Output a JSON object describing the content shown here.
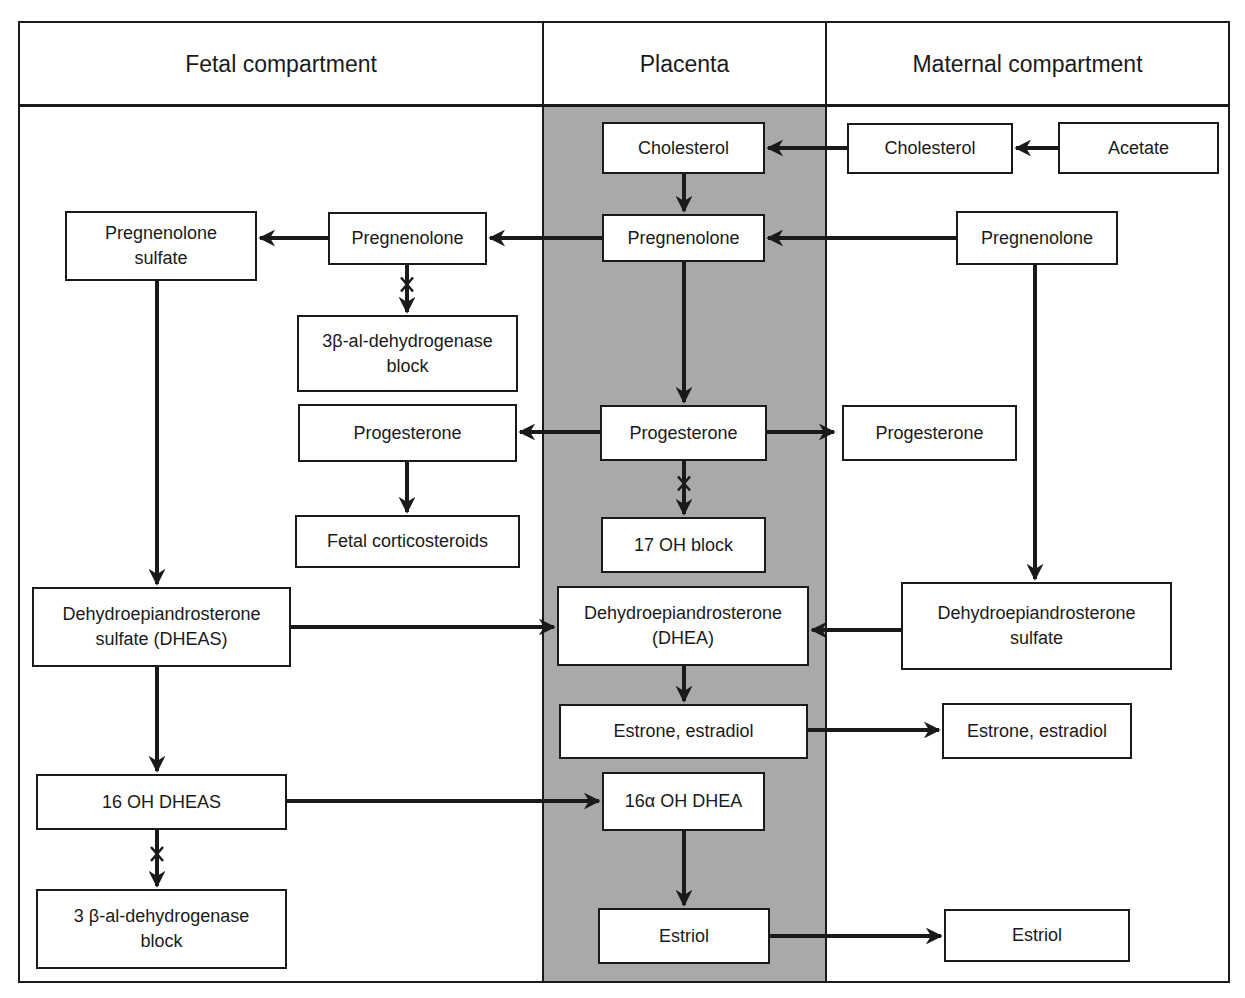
{
  "diagram": {
    "colors": {
      "placenta_fill": "#a9a9a9",
      "line": "#1a1a1a",
      "box_fill": "#ffffff"
    },
    "columns": [
      {
        "id": "fetal",
        "label": "Fetal compartment"
      },
      {
        "id": "placenta",
        "label": "Placenta"
      },
      {
        "id": "maternal",
        "label": "Maternal compartment"
      }
    ],
    "boxes": [
      {
        "id": "plac-cholesterol",
        "col": "placenta",
        "label": "Cholesterol",
        "x": 602,
        "y": 122,
        "w": 163,
        "h": 52
      },
      {
        "id": "mat-cholesterol",
        "col": "maternal",
        "label": "Cholesterol",
        "x": 847,
        "y": 123,
        "w": 166,
        "h": 51
      },
      {
        "id": "mat-acetate",
        "col": "maternal",
        "label": "Acetate",
        "x": 1058,
        "y": 122,
        "w": 161,
        "h": 52
      },
      {
        "id": "fet-preg-sulfate",
        "col": "fetal",
        "label": "Pregnenolone\nsulfate",
        "x": 65,
        "y": 211,
        "w": 192,
        "h": 70
      },
      {
        "id": "fet-pregnenolone",
        "col": "fetal",
        "label": "Pregnenolone",
        "x": 328,
        "y": 212,
        "w": 159,
        "h": 53
      },
      {
        "id": "plac-pregnenolone",
        "col": "placenta",
        "label": "Pregnenolone",
        "x": 602,
        "y": 214,
        "w": 163,
        "h": 48
      },
      {
        "id": "mat-pregnenolone",
        "col": "maternal",
        "label": "Pregnenolone",
        "x": 956,
        "y": 211,
        "w": 162,
        "h": 54
      },
      {
        "id": "fet-3b-block-1",
        "col": "fetal",
        "label": "3β-al-dehydrogenase\nblock",
        "x": 297,
        "y": 315,
        "w": 221,
        "h": 77
      },
      {
        "id": "fet-progesterone",
        "col": "fetal",
        "label": "Progesterone",
        "x": 298,
        "y": 404,
        "w": 219,
        "h": 58
      },
      {
        "id": "plac-progesterone",
        "col": "placenta",
        "label": "Progesterone",
        "x": 600,
        "y": 405,
        "w": 167,
        "h": 56
      },
      {
        "id": "mat-progesterone",
        "col": "maternal",
        "label": "Progesterone",
        "x": 842,
        "y": 405,
        "w": 175,
        "h": 56
      },
      {
        "id": "fet-corticosteroids",
        "col": "fetal",
        "label": "Fetal corticosteroids",
        "x": 295,
        "y": 515,
        "w": 225,
        "h": 53
      },
      {
        "id": "plac-17oh-block",
        "col": "placenta",
        "label": "17 OH block",
        "x": 601,
        "y": 517,
        "w": 165,
        "h": 56
      },
      {
        "id": "fet-dheas",
        "col": "fetal",
        "label": "Dehydroepiandrosterone\nsulfate (DHEAS)",
        "x": 32,
        "y": 587,
        "w": 259,
        "h": 80
      },
      {
        "id": "plac-dhea",
        "col": "placenta",
        "label": "Dehydroepiandrosterone\n(DHEA)",
        "x": 557,
        "y": 586,
        "w": 252,
        "h": 80
      },
      {
        "id": "mat-dhea-sulfate",
        "col": "maternal",
        "label": "Dehydroepiandrosterone\nsulfate",
        "x": 901,
        "y": 582,
        "w": 271,
        "h": 88
      },
      {
        "id": "plac-estrone",
        "col": "placenta",
        "label": "Estrone, estradiol",
        "x": 559,
        "y": 704,
        "w": 249,
        "h": 55
      },
      {
        "id": "mat-estrone",
        "col": "maternal",
        "label": "Estrone, estradiol",
        "x": 942,
        "y": 703,
        "w": 190,
        "h": 56
      },
      {
        "id": "fet-16oh-dheas",
        "col": "fetal",
        "label": "16  OH DHEAS",
        "x": 36,
        "y": 774,
        "w": 251,
        "h": 56
      },
      {
        "id": "plac-16a-oh-dhea",
        "col": "placenta",
        "label": "16α OH DHEA",
        "x": 602,
        "y": 772,
        "w": 163,
        "h": 59
      },
      {
        "id": "fet-3b-block-2",
        "col": "fetal",
        "label": "3 β-al-dehydrogenase\nblock",
        "x": 36,
        "y": 889,
        "w": 251,
        "h": 80
      },
      {
        "id": "plac-estriol",
        "col": "placenta",
        "label": "Estriol",
        "x": 598,
        "y": 908,
        "w": 172,
        "h": 56
      },
      {
        "id": "mat-estriol",
        "col": "maternal",
        "label": "Estriol",
        "x": 944,
        "y": 909,
        "w": 186,
        "h": 53
      }
    ],
    "arrows": [
      {
        "from": "mat-acetate",
        "to": "mat-cholesterol",
        "points": [
          [
            1058,
            148
          ],
          [
            1016,
            148
          ]
        ],
        "blocked": false
      },
      {
        "from": "mat-cholesterol",
        "to": "plac-cholesterol",
        "points": [
          [
            847,
            148
          ],
          [
            768,
            148
          ]
        ],
        "blocked": false
      },
      {
        "from": "plac-cholesterol",
        "to": "plac-pregnenolone",
        "points": [
          [
            684,
            174
          ],
          [
            684,
            211
          ]
        ],
        "blocked": false
      },
      {
        "from": "mat-pregnenolone",
        "to": "plac-pregnenolone",
        "points": [
          [
            956,
            238
          ],
          [
            768,
            238
          ]
        ],
        "blocked": false
      },
      {
        "from": "plac-pregnenolone",
        "to": "fet-pregnenolone",
        "points": [
          [
            602,
            238
          ],
          [
            490,
            238
          ]
        ],
        "blocked": false
      },
      {
        "from": "fet-pregnenolone",
        "to": "fet-preg-sulfate",
        "points": [
          [
            328,
            238
          ],
          [
            260,
            238
          ]
        ],
        "blocked": false
      },
      {
        "from": "fet-pregnenolone",
        "to": "fet-3b-block-1",
        "points": [
          [
            407,
            265
          ],
          [
            407,
            312
          ]
        ],
        "blocked": true
      },
      {
        "from": "plac-pregnenolone",
        "to": "plac-progesterone",
        "points": [
          [
            684,
            262
          ],
          [
            684,
            402
          ]
        ],
        "blocked": false
      },
      {
        "from": "plac-progesterone",
        "to": "fet-progesterone",
        "points": [
          [
            600,
            432
          ],
          [
            520,
            432
          ]
        ],
        "blocked": false
      },
      {
        "from": "plac-progesterone",
        "to": "mat-progesterone",
        "points": [
          [
            767,
            432
          ],
          [
            834,
            432
          ]
        ],
        "blocked": false
      },
      {
        "from": "fet-progesterone",
        "to": "fet-corticosteroids",
        "points": [
          [
            407,
            462
          ],
          [
            407,
            512
          ]
        ],
        "blocked": false
      },
      {
        "from": "plac-progesterone",
        "to": "plac-17oh-block",
        "points": [
          [
            684,
            461
          ],
          [
            684,
            514
          ]
        ],
        "blocked": true
      },
      {
        "from": "fet-preg-sulfate",
        "to": "fet-dheas",
        "points": [
          [
            157,
            281
          ],
          [
            157,
            584
          ]
        ],
        "blocked": false
      },
      {
        "from": "mat-pregnenolone",
        "to": "mat-dhea-sulfate",
        "points": [
          [
            1035,
            265
          ],
          [
            1035,
            579
          ]
        ],
        "blocked": false
      },
      {
        "from": "fet-dheas",
        "to": "plac-dhea",
        "points": [
          [
            291,
            627
          ],
          [
            554,
            627
          ]
        ],
        "blocked": false
      },
      {
        "from": "mat-dhea-sulfate",
        "to": "plac-dhea",
        "points": [
          [
            901,
            630
          ],
          [
            812,
            630
          ]
        ],
        "blocked": false
      },
      {
        "from": "plac-dhea",
        "to": "plac-estrone",
        "points": [
          [
            684,
            666
          ],
          [
            684,
            701
          ]
        ],
        "blocked": false
      },
      {
        "from": "plac-estrone",
        "to": "mat-estrone",
        "points": [
          [
            808,
            730
          ],
          [
            939,
            730
          ]
        ],
        "blocked": false
      },
      {
        "from": "fet-dheas",
        "to": "fet-16oh-dheas",
        "points": [
          [
            157,
            667
          ],
          [
            157,
            771
          ]
        ],
        "blocked": false
      },
      {
        "from": "fet-16oh-dheas",
        "to": "plac-16a-oh-dhea",
        "points": [
          [
            287,
            801
          ],
          [
            599,
            801
          ]
        ],
        "blocked": false
      },
      {
        "from": "fet-16oh-dheas",
        "to": "fet-3b-block-2",
        "points": [
          [
            157,
            830
          ],
          [
            157,
            886
          ]
        ],
        "blocked": true
      },
      {
        "from": "plac-16a-oh-dhea",
        "to": "plac-estriol",
        "points": [
          [
            684,
            831
          ],
          [
            684,
            905
          ]
        ],
        "blocked": false
      },
      {
        "from": "plac-estriol",
        "to": "mat-estriol",
        "points": [
          [
            770,
            936
          ],
          [
            941,
            936
          ]
        ],
        "blocked": false
      }
    ]
  }
}
